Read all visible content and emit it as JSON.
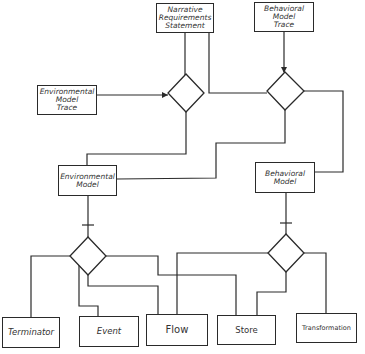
{
  "diagram": {
    "type": "hand-drawn entity relationship diagram",
    "top_boxes": {
      "narrative": "Narrative\nRequirements\nStatement",
      "behavioral_trace": "Behavioral\nModel\nTrace",
      "environmental_trace": "Environmental\nModel\nTrace"
    },
    "middle_boxes": {
      "environmental_model": "Environmental\nModel",
      "behavioral_model": "Behavioral\nModel"
    },
    "bottom_boxes": {
      "terminator": "Terminator",
      "event": "Event",
      "flow": "Flow",
      "store": "Store",
      "transformation": "Transformation"
    },
    "relationships": [
      {
        "id": "rel-top-left",
        "connects": [
          "Narrative Requirements Statement",
          "Environmental Model Trace",
          "Environmental Model"
        ]
      },
      {
        "id": "rel-top-right",
        "connects": [
          "Narrative Requirements Statement",
          "Behavioral Model Trace",
          "Behavioral Model",
          "Environmental Model"
        ]
      },
      {
        "id": "rel-bottom-left",
        "connects": [
          "Environmental Model",
          "Terminator",
          "Event",
          "Flow",
          "Store"
        ]
      },
      {
        "id": "rel-bottom-right",
        "connects": [
          "Behavioral Model",
          "Flow",
          "Store",
          "Transformation"
        ]
      }
    ]
  }
}
